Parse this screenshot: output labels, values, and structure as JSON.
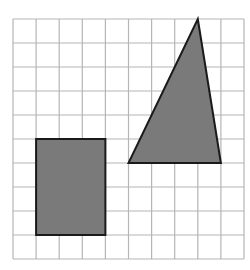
{
  "figure": {
    "grid": {
      "columns": 10,
      "rows": 10,
      "origin_x": 13,
      "origin_y": 19,
      "cell_width": 23.1,
      "cell_height": 24,
      "line_color": "#b5b5b5"
    },
    "shapes": [
      {
        "type": "rectangle",
        "name": "shaded-rectangle",
        "grid_points": [
          [
            1,
            5
          ],
          [
            4,
            5
          ],
          [
            4,
            9
          ],
          [
            1,
            9
          ]
        ],
        "fill": "#7a7a7a",
        "stroke": "#1a1a1a"
      },
      {
        "type": "triangle",
        "name": "shaded-triangle",
        "grid_points": [
          [
            8,
            0
          ],
          [
            9,
            6
          ],
          [
            5,
            6
          ]
        ],
        "fill": "#7a7a7a",
        "stroke": "#1a1a1a"
      }
    ]
  }
}
